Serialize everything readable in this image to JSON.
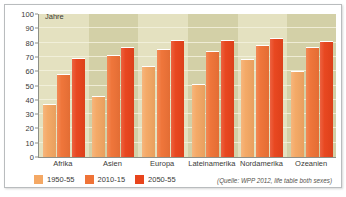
{
  "chart_data": {
    "type": "bar",
    "title": "",
    "xlabel": "",
    "ylabel": "Jahre",
    "ylim": [
      0,
      100
    ],
    "yticks": [
      0,
      10,
      20,
      30,
      40,
      50,
      60,
      70,
      80,
      90,
      100
    ],
    "grid": true,
    "legend_position": "bottom-left",
    "categories": [
      "Afrika",
      "Asien",
      "Europa",
      "Lateinamerika",
      "Nordamerika",
      "Ozeanien"
    ],
    "series": [
      {
        "name": "1950-55",
        "color": "#f4a864",
        "values": [
          37,
          42.5,
          63.5,
          51,
          68.5,
          60
        ]
      },
      {
        "name": "2010-15",
        "color": "#ef7337",
        "values": [
          58,
          71,
          75.5,
          74,
          78,
          77
        ]
      },
      {
        "name": "2050-55",
        "color": "#e8441c",
        "values": [
          69.5,
          77,
          81.5,
          82,
          83.5,
          81
        ]
      }
    ],
    "annotations": [
      "(Quelle: WPP 2012, life table both sexes)"
    ]
  },
  "axis": {
    "y_title": "Jahre"
  },
  "source": {
    "note": "(Quelle: WPP 2012, life table both sexes)"
  }
}
